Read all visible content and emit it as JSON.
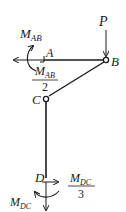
{
  "diagram": {
    "colors": {
      "ink": "#1a1a1a",
      "background": "#ffffff"
    },
    "nodes": {
      "A": {
        "label": "A"
      },
      "B": {
        "label": "B"
      },
      "C": {
        "label": "C"
      },
      "D": {
        "label": "D"
      }
    },
    "loads": {
      "P": {
        "label": "P",
        "direction": "down",
        "at": "B"
      }
    },
    "moments": {
      "M_AB": {
        "main": "M",
        "sub": "AB"
      },
      "M_AB_half": {
        "main": "M",
        "sub": "AB",
        "denominator": "2"
      },
      "M_DC": {
        "main": "M",
        "sub": "DC"
      },
      "M_DC_third": {
        "main": "M",
        "sub": "DC",
        "denominator": "3"
      }
    },
    "members": [
      {
        "from": "A",
        "to": "B"
      },
      {
        "from": "B",
        "to": "C"
      },
      {
        "from": "C",
        "to": "D"
      }
    ],
    "hinges": [
      "B",
      "C"
    ]
  }
}
